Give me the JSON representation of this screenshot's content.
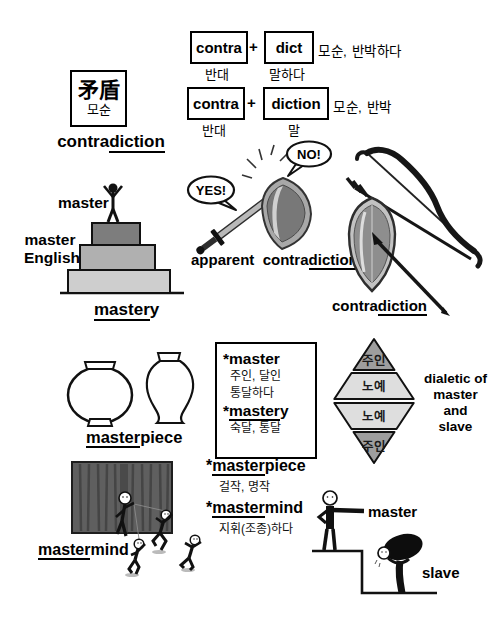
{
  "etymology": {
    "hanja": "矛盾",
    "hanja_korean": "모순",
    "headword": {
      "plain": "contra",
      "underline": "diction"
    },
    "rows": [
      {
        "part1": "contra",
        "plus": "+",
        "part2": "dict",
        "meaning": "모순, 반박하다",
        "gloss1": "반대",
        "gloss2": "말하다"
      },
      {
        "part1": "contra",
        "plus": "+",
        "part2": "diction",
        "meaning": "모순, 반박",
        "gloss1": "반대",
        "gloss2": "말"
      }
    ]
  },
  "pyramid": {
    "top_label": "master",
    "side_line1": "master",
    "side_line2": "English",
    "caption_underline": "master",
    "caption_rest": "y"
  },
  "clash": {
    "bubble_yes": "YES!",
    "bubble_no": "NO!",
    "caption_word1": "apparent",
    "caption_plain": "contra",
    "caption_underline": "diction"
  },
  "bowshield": {
    "caption_plain": "contra",
    "caption_underline": "diction"
  },
  "vases": {
    "caption_underline": "master",
    "caption_rest": "piece"
  },
  "wordbox": {
    "master_word": "*master",
    "master_gloss1": "주인, 달인",
    "master_gloss2": "통달하다",
    "mastery_star": "*",
    "mastery_underline": "master",
    "mastery_rest": "y",
    "mastery_gloss": "숙달, 통달",
    "masterpiece_star": "*",
    "masterpiece_underline": "master",
    "masterpiece_rest": "piece",
    "masterpiece_gloss": "걸작, 명작",
    "mastermind_star": "*",
    "mastermind_underline": "master",
    "mastermind_rest": "mind",
    "mastermind_gloss": "지휘(조종)하다"
  },
  "diamond": {
    "bands": [
      "주인",
      "노예",
      "노예",
      "주인"
    ],
    "label_lines": [
      "dialetic of",
      "master",
      "and",
      "slave"
    ]
  },
  "theater": {
    "caption_underline": "master",
    "caption_rest": "mind"
  },
  "hierarchy": {
    "master_label": "master",
    "slave_label": "slave"
  },
  "colors": {
    "tier_top": "#7d7d7d",
    "tier_mid": "#b0b0b0",
    "tier_bottom": "#cecece",
    "diamond_dark": "#9e9e9e",
    "diamond_light": "#dedede",
    "curtain": "#5f5f5f"
  }
}
